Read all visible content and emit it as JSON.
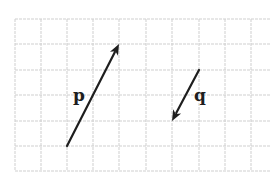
{
  "diagram": {
    "type": "vector-grid",
    "grid": {
      "columns_x": [
        15,
        41,
        67,
        93,
        119,
        146,
        172,
        199,
        225,
        251
      ],
      "rows_y": [
        19,
        44,
        70,
        95,
        121,
        146,
        171
      ],
      "left": 15,
      "right": 271,
      "top": 19,
      "bottom": 171,
      "line_color": "#cfcfcf"
    },
    "vectors": [
      {
        "name": "p",
        "label": "p",
        "tail": {
          "x": 67,
          "y": 146
        },
        "tip": {
          "x": 119,
          "y": 44
        },
        "grid_components": {
          "dx": 2,
          "dy": 4
        },
        "label_pos": {
          "x": 73,
          "y": 101
        },
        "color": "#1e1e1e"
      },
      {
        "name": "q",
        "label": "q",
        "tail": {
          "x": 199,
          "y": 70
        },
        "tip": {
          "x": 172,
          "y": 121
        },
        "grid_components": {
          "dx": -1,
          "dy": -2
        },
        "label_pos": {
          "x": 194,
          "y": 101
        },
        "color": "#1e1e1e"
      }
    ]
  }
}
